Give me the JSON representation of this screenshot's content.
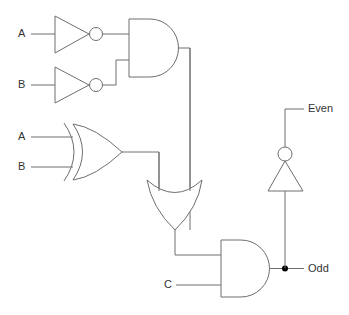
{
  "diagram": {
    "type": "logic-circuit",
    "inputs": {
      "not1": "A",
      "not2": "B",
      "xor_a": "A",
      "xor_b": "B",
      "and2_c": "C"
    },
    "outputs": {
      "even": "Even",
      "odd": "Odd"
    },
    "gates": [
      {
        "id": "not1",
        "type": "NOT",
        "input": "A"
      },
      {
        "id": "not2",
        "type": "NOT",
        "input": "B"
      },
      {
        "id": "and1",
        "type": "AND",
        "inputs": [
          "not1",
          "not2"
        ]
      },
      {
        "id": "xor1",
        "type": "XOR",
        "inputs": [
          "A",
          "B"
        ]
      },
      {
        "id": "or1",
        "type": "OR",
        "inputs": [
          "xor1",
          "and1"
        ]
      },
      {
        "id": "and2",
        "type": "AND",
        "inputs": [
          "or1",
          "C"
        ],
        "output": "Odd"
      },
      {
        "id": "not3",
        "type": "NOT",
        "input": "and2",
        "output": "Even"
      }
    ],
    "colors": {
      "stroke": "#6e6e6e",
      "text": "#333333",
      "junction": "#000000"
    }
  }
}
